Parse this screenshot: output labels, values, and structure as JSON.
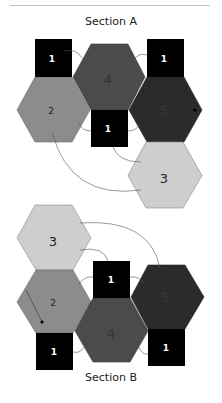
{
  "sections": [
    {
      "title": "Section A",
      "squares": [
        {
          "label": "1",
          "x": 35,
          "y": 39,
          "w": 37,
          "h": 38
        },
        {
          "label": "1",
          "x": 147,
          "y": 39,
          "w": 37,
          "h": 38
        },
        {
          "label": "1",
          "x": 91,
          "y": 110,
          "w": 37,
          "h": 37
        }
      ],
      "hexagons": [
        {
          "label": "2",
          "cx": 53.5,
          "cy": 110,
          "color": "#8c8c8c",
          "text_color": "#222222"
        },
        {
          "label": "4",
          "cx": 109,
          "cy": 77,
          "color": "#4b4b4b",
          "text_color": "#333333"
        },
        {
          "label": "5",
          "cx": 165.5,
          "cy": 110,
          "color": "#2b2b2b",
          "text_color": "#3a3a3a"
        },
        {
          "label": "3",
          "cx": 165,
          "cy": 175.5,
          "color": "#cecece",
          "text_color": "#222222"
        }
      ]
    },
    {
      "title": "Section B",
      "squares": [
        {
          "label": "1",
          "x": 93,
          "y": 261,
          "w": 37,
          "h": 37
        },
        {
          "label": "1",
          "x": 36,
          "y": 333,
          "w": 37,
          "h": 37
        },
        {
          "label": "1",
          "x": 148,
          "y": 329,
          "w": 37,
          "h": 37
        }
      ],
      "hexagons": [
        {
          "label": "3",
          "cx": 54,
          "cy": 238,
          "color": "#cecece",
          "text_color": "#222222"
        },
        {
          "label": "2",
          "cx": 54.5,
          "cy": 302,
          "color": "#8c8c8c",
          "text_color": "#222222"
        },
        {
          "label": "4",
          "cx": 111.5,
          "cy": 331,
          "color": "#4b4b4b",
          "text_color": "#333333"
        },
        {
          "label": "5",
          "cx": 167.5,
          "cy": 297,
          "color": "#2b2b2b",
          "text_color": "#3a3a3a"
        }
      ]
    }
  ],
  "colors": {
    "square": "#000000",
    "square_text": "#ffffff",
    "connector": "#555555",
    "divider": "#bbbbbb"
  }
}
